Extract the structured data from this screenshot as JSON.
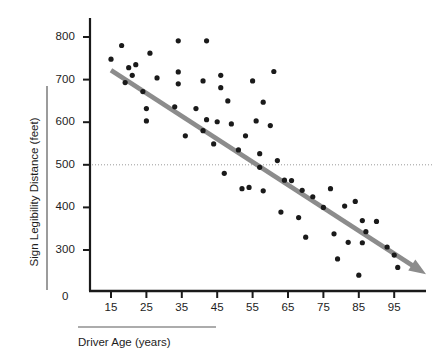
{
  "chart_data": {
    "type": "scatter",
    "title": "",
    "xlabel": "Driver Age (years)",
    "ylabel": "Sign Legibility Distance (feet)",
    "xlim": [
      5,
      105
    ],
    "ylim": [
      230,
      820
    ],
    "xticks": [
      15,
      25,
      35,
      45,
      55,
      65,
      75,
      85,
      95
    ],
    "yticks": [
      300,
      400,
      500,
      600,
      700,
      800
    ],
    "y_origin_label": "0",
    "grid": false,
    "legend": null,
    "series": [
      {
        "name": "Observations",
        "type": "scatter",
        "marker": "circle",
        "color": "#1a1a1a",
        "points": [
          [
            15,
            748
          ],
          [
            18,
            780
          ],
          [
            19,
            693
          ],
          [
            20,
            728
          ],
          [
            21,
            710
          ],
          [
            22,
            735
          ],
          [
            24,
            672
          ],
          [
            25,
            632
          ],
          [
            25,
            603
          ],
          [
            26,
            762
          ],
          [
            28,
            704
          ],
          [
            33,
            636
          ],
          [
            34,
            718
          ],
          [
            34,
            791
          ],
          [
            34,
            690
          ],
          [
            36,
            568
          ],
          [
            39,
            632
          ],
          [
            41,
            580
          ],
          [
            41,
            697
          ],
          [
            42,
            606
          ],
          [
            42,
            791
          ],
          [
            44,
            549
          ],
          [
            45,
            601
          ],
          [
            46,
            681
          ],
          [
            46,
            710
          ],
          [
            47,
            480
          ],
          [
            48,
            650
          ],
          [
            49,
            596
          ],
          [
            51,
            535
          ],
          [
            52,
            444
          ],
          [
            53,
            568
          ],
          [
            54,
            447
          ],
          [
            55,
            697
          ],
          [
            56,
            603
          ],
          [
            57,
            494
          ],
          [
            57,
            526
          ],
          [
            58,
            647
          ],
          [
            58,
            439
          ],
          [
            60,
            592
          ],
          [
            61,
            719
          ],
          [
            62,
            510
          ],
          [
            63,
            389
          ],
          [
            64,
            464
          ],
          [
            66,
            463
          ],
          [
            68,
            376
          ],
          [
            69,
            440
          ],
          [
            70,
            330
          ],
          [
            72,
            425
          ],
          [
            75,
            400
          ],
          [
            77,
            444
          ],
          [
            78,
            338
          ],
          [
            79,
            279
          ],
          [
            81,
            403
          ],
          [
            82,
            318
          ],
          [
            84,
            414
          ],
          [
            85,
            241
          ],
          [
            86,
            369
          ],
          [
            86,
            317
          ],
          [
            87,
            343
          ],
          [
            90,
            367
          ],
          [
            93,
            307
          ],
          [
            95,
            288
          ],
          [
            96,
            259
          ]
        ]
      },
      {
        "name": "Trend line",
        "type": "line",
        "color": "#8c8c8c",
        "arrow": true,
        "start": [
          15,
          722
        ],
        "end": [
          104,
          243
        ]
      },
      {
        "name": "Reference line at 500 feet",
        "type": "hline",
        "value": 500,
        "style": "dotted",
        "color": "#9a9a9a"
      }
    ]
  },
  "axes": {
    "y_axis_color": "#1a1a1a",
    "x_axis_color": "#1a1a1a",
    "tick_color": "#1a1a1a"
  }
}
